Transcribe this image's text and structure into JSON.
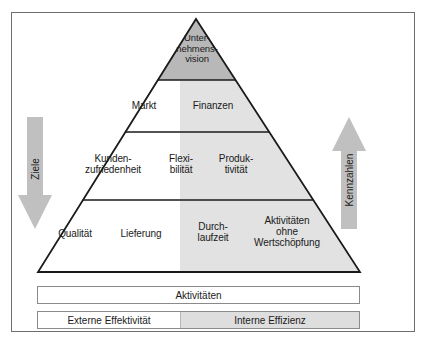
{
  "figure": {
    "colors": {
      "frame_border": "#6e6e6e",
      "pyramid_outline": "#1a1a1a",
      "apex_fill": "#b8b8b8",
      "efficiency_fill": "#e2e2e2",
      "white_fill": "#ffffff",
      "arrow_fill": "#c0c0c0",
      "text": "#1a1a1a"
    }
  },
  "pyramid": {
    "tiers": [
      {
        "level": 1,
        "name": "vision",
        "cells": [
          {
            "id": "vision",
            "text": "Unter-\nnehmens-\nvision",
            "fill": "apex_gray"
          }
        ]
      },
      {
        "level": 2,
        "name": "strategy",
        "cells": [
          {
            "id": "markt",
            "text": "Markt",
            "fill": "white"
          },
          {
            "id": "finanzen",
            "text": "Finanzen",
            "fill": "gray"
          }
        ]
      },
      {
        "level": 3,
        "name": "performance",
        "cells": [
          {
            "id": "kundenzufriedenheit",
            "text": "Kunden-\nzufriedenheit",
            "fill": "white"
          },
          {
            "id": "flexibilitaet",
            "text": "Flexi-\nbilität",
            "fill": "white"
          },
          {
            "id": "produktivitaet",
            "text": "Produk-\ntivität",
            "fill": "gray"
          }
        ]
      },
      {
        "level": 4,
        "name": "operations",
        "cells": [
          {
            "id": "qualitaet",
            "text": "Qualität",
            "fill": "white"
          },
          {
            "id": "lieferung",
            "text": "Lieferung",
            "fill": "white"
          },
          {
            "id": "durchlaufzeit",
            "text": "Durch-\nlaufzeit",
            "fill": "gray"
          },
          {
            "id": "aktivitaeten_ohne_wertschoepfung",
            "text": "Aktivitäten\nohne\nWertschöpfung",
            "fill": "gray"
          }
        ]
      }
    ]
  },
  "arrows": {
    "left": {
      "label": "Ziele",
      "direction": "down",
      "icon": "arrow-down-icon"
    },
    "right": {
      "label": "Kennzahlen",
      "direction": "up",
      "icon": "arrow-up-icon"
    }
  },
  "bars": {
    "activities": {
      "label": "Aktivitäten"
    },
    "split": {
      "left_label": "Externe Effektivität",
      "right_label": "Interne Effizienz"
    }
  }
}
